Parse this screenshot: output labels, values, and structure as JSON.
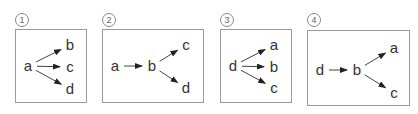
{
  "options": [
    {
      "number": "1",
      "nodes": [
        {
          "id": "a",
          "x": 28,
          "y": 66
        },
        {
          "id": "b",
          "x": 70,
          "y": 45
        },
        {
          "id": "c",
          "x": 70,
          "y": 67
        },
        {
          "id": "d",
          "x": 70,
          "y": 89
        }
      ],
      "edges": [
        [
          "a",
          "b"
        ],
        [
          "a",
          "c"
        ],
        [
          "a",
          "d"
        ]
      ]
    },
    {
      "number": "2",
      "nodes": [
        {
          "id": "a",
          "x": 115,
          "y": 66
        },
        {
          "id": "b",
          "x": 152,
          "y": 66
        },
        {
          "id": "c",
          "x": 186,
          "y": 45
        },
        {
          "id": "d",
          "x": 186,
          "y": 88
        }
      ],
      "edges": [
        [
          "a",
          "b"
        ],
        [
          "b",
          "c"
        ],
        [
          "b",
          "d"
        ]
      ]
    },
    {
      "number": "3",
      "nodes": [
        {
          "id": "d",
          "x": 233,
          "y": 66
        },
        {
          "id": "a",
          "x": 274,
          "y": 45
        },
        {
          "id": "b",
          "x": 274,
          "y": 67
        },
        {
          "id": "c",
          "x": 274,
          "y": 88
        }
      ],
      "edges": [
        [
          "d",
          "a"
        ],
        [
          "d",
          "b"
        ],
        [
          "d",
          "c"
        ]
      ]
    },
    {
      "number": "4",
      "nodes": [
        {
          "id": "d",
          "x": 320,
          "y": 70
        },
        {
          "id": "b",
          "x": 357,
          "y": 70
        },
        {
          "id": "a",
          "x": 394,
          "y": 48
        },
        {
          "id": "c",
          "x": 394,
          "y": 93
        }
      ],
      "edges": [
        [
          "d",
          "b"
        ],
        [
          "b",
          "a"
        ],
        [
          "b",
          "c"
        ]
      ]
    }
  ]
}
